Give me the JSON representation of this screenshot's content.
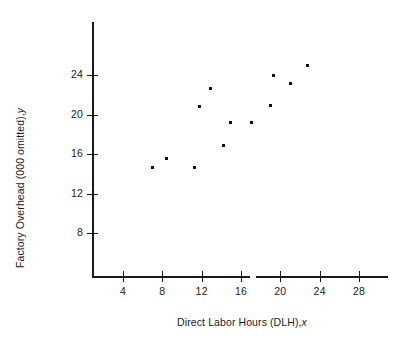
{
  "chart_data": {
    "type": "scatter",
    "title": "",
    "xlabel": "Direct Labor Hours (DLH),  x",
    "ylabel": "Factory Overhead (000 omitted),  y",
    "xlabel_text": "Direct Labor Hours (DLH),",
    "xlabel_variable": "x",
    "ylabel_text": "Factory Overhead (000 omitted),",
    "ylabel_variable": "y",
    "x_ticks": [
      4,
      8,
      12,
      16,
      20,
      24,
      28
    ],
    "y_ticks": [
      8,
      12,
      16,
      20,
      24
    ],
    "x_tick_labels": [
      "4",
      "8",
      "12",
      "16",
      "20",
      "24",
      "28"
    ],
    "y_tick_labels": [
      "8",
      "12",
      "16",
      "20",
      "24"
    ],
    "xlim": [
      0,
      31
    ],
    "ylim": [
      0,
      26.5
    ],
    "grid": false,
    "legend": false,
    "marker_color": "#111111",
    "axis_color": "#1a1a1a",
    "background_color": "#ffffff",
    "x": [
      7.0,
      8.4,
      11.3,
      11.8,
      12.9,
      14.2,
      14.9,
      17.1,
      19.0,
      19.3,
      21.0,
      22.8
    ],
    "y": [
      14.6,
      15.5,
      14.6,
      20.8,
      22.6,
      16.9,
      19.2,
      19.2,
      20.9,
      24.0,
      23.1,
      25.0
    ],
    "points": [
      {
        "x": 7.0,
        "y": 14.6
      },
      {
        "x": 8.4,
        "y": 15.5
      },
      {
        "x": 11.3,
        "y": 14.6
      },
      {
        "x": 11.8,
        "y": 20.8
      },
      {
        "x": 12.9,
        "y": 22.6
      },
      {
        "x": 14.2,
        "y": 16.9
      },
      {
        "x": 14.9,
        "y": 19.2
      },
      {
        "x": 17.1,
        "y": 19.2
      },
      {
        "x": 19.0,
        "y": 20.9
      },
      {
        "x": 19.3,
        "y": 24.0
      },
      {
        "x": 21.0,
        "y": 23.1
      },
      {
        "x": 22.8,
        "y": 25.0
      }
    ]
  }
}
